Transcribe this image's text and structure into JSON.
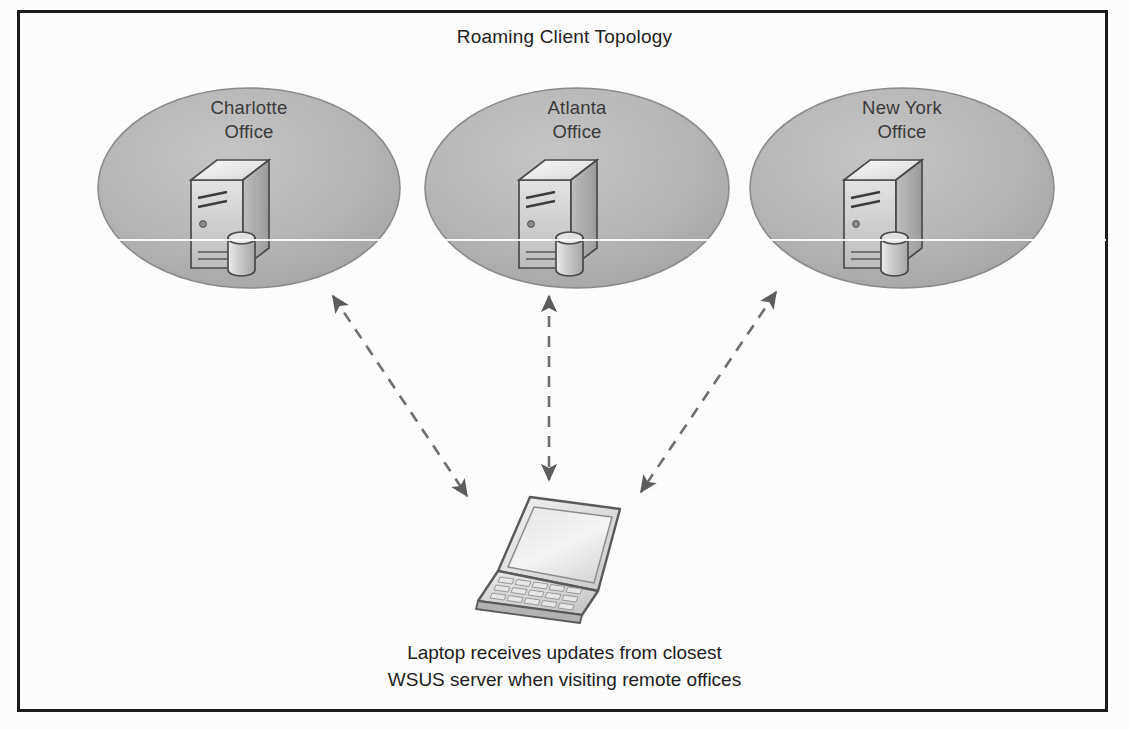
{
  "diagram": {
    "title": "Roaming Client Topology",
    "caption": {
      "line1": "Laptop receives updates from closest",
      "line2": "WSUS server when visiting remote offices"
    },
    "colors": {
      "ellipse_fill": "#b6b6b6",
      "ellipse_stroke": "#8a8a8a",
      "border": "#1b1b1b",
      "arrow": "#6f6f6f",
      "text": "#222222",
      "server_front": "#d8d8d8",
      "server_top": "#f2f2f2",
      "server_side": "#a9a9a9",
      "laptop_screen": "#e2e2e2",
      "laptop_base": "#cfcfcf"
    },
    "sites": [
      {
        "id": "charlotte",
        "label_line1": "Charlotte",
        "label_line2": "Office",
        "icon": "server-icon",
        "cx": 249,
        "cy": 188,
        "rx": 151,
        "ry": 100
      },
      {
        "id": "atlanta",
        "label_line1": "Atlanta",
        "label_line2": "Office",
        "icon": "server-icon",
        "cx": 577,
        "cy": 188,
        "rx": 152,
        "ry": 100
      },
      {
        "id": "newyork",
        "label_line1": "New York",
        "label_line2": "Office",
        "icon": "server-icon",
        "cx": 902,
        "cy": 188,
        "rx": 152,
        "ry": 100
      }
    ],
    "client": {
      "id": "laptop",
      "icon": "laptop-icon"
    },
    "connections": [
      {
        "id": "charlotte-to-laptop",
        "from": "charlotte",
        "to": "laptop",
        "style": "dashed",
        "arrows": "both"
      },
      {
        "id": "atlanta-to-laptop",
        "from": "atlanta",
        "to": "laptop",
        "style": "dashed",
        "arrows": "both"
      },
      {
        "id": "newyork-to-laptop",
        "from": "newyork",
        "to": "laptop",
        "style": "dashed",
        "arrows": "both"
      }
    ]
  }
}
